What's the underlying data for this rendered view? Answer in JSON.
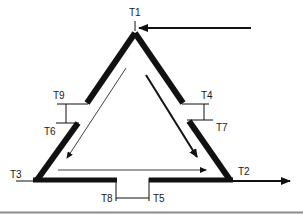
{
  "diagram": {
    "type": "triangular-circuit",
    "colors": {
      "stroke": "#111111",
      "background": "#ffffff",
      "baseline": "#8a8a8a"
    },
    "terminals": [
      {
        "id": "T1",
        "label": "T1",
        "position": "apex"
      },
      {
        "id": "T2",
        "label": "T2",
        "position": "bottom-right"
      },
      {
        "id": "T3",
        "label": "T3",
        "position": "bottom-left"
      },
      {
        "id": "T4",
        "label": "T4",
        "position": "right-break-upper"
      },
      {
        "id": "T5",
        "label": "T5",
        "position": "bottom-break-right"
      },
      {
        "id": "T6",
        "label": "T6",
        "position": "left-break-lower"
      },
      {
        "id": "T7",
        "label": "T7",
        "position": "right-break-lower"
      },
      {
        "id": "T8",
        "label": "T8",
        "position": "bottom-break-left"
      },
      {
        "id": "T9",
        "label": "T9",
        "position": "left-break-upper"
      }
    ],
    "arrows": [
      {
        "name": "input-arrow",
        "from": "right",
        "to": "T1",
        "weight": "thick"
      },
      {
        "name": "output-arrow",
        "from": "T2",
        "to": "right",
        "weight": "thick"
      },
      {
        "name": "inner-left-arrow",
        "direction": "down-left",
        "weight": "thin"
      },
      {
        "name": "inner-right-arrow",
        "direction": "down-right",
        "weight": "thick"
      },
      {
        "name": "inner-bottom-arrow",
        "direction": "right",
        "weight": "thin"
      }
    ]
  }
}
